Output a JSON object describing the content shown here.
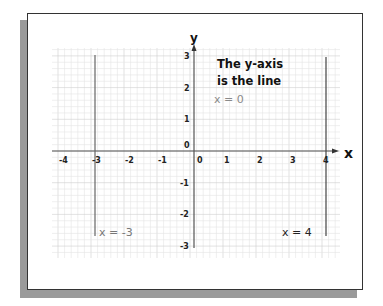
{
  "axes": {
    "x_label": "x",
    "y_label": "y",
    "x_ticks": [
      "-4",
      "-3",
      "-2",
      "-1",
      "0",
      "1",
      "2",
      "3",
      "4"
    ],
    "y_ticks": [
      "3",
      "2",
      "1",
      "0",
      "-1",
      "-2",
      "-3"
    ]
  },
  "annotation": {
    "line1": "The y-axis",
    "line2": "is the line",
    "equation": "x = 0"
  },
  "lines": [
    {
      "label": "x = -3",
      "x": -3
    },
    {
      "label": "x = 4",
      "x": 4
    }
  ],
  "colors": {
    "grid_minor": "#e4e4e4",
    "grid_major": "#cfcfcf",
    "axis": "#555555",
    "line": "#666666",
    "label_gray": "#8a8a8a",
    "text": "#111111"
  },
  "chart_data": {
    "type": "line",
    "title": "",
    "xlabel": "x",
    "ylabel": "y",
    "xlim": [
      -4,
      4
    ],
    "ylim": [
      -3,
      3
    ],
    "grid": true,
    "series": [
      {
        "name": "x = -3",
        "x": [
          -3,
          -3
        ],
        "y": [
          3,
          -2.5
        ]
      },
      {
        "name": "x = 0 (y-axis)",
        "x": [
          0,
          0
        ],
        "y": [
          3.3,
          -3
        ]
      },
      {
        "name": "x = 4",
        "x": [
          4,
          4
        ],
        "y": [
          3,
          -2.5
        ]
      }
    ],
    "annotations": [
      "The y-axis is the line x = 0",
      "x = -3",
      "x = 4"
    ]
  }
}
